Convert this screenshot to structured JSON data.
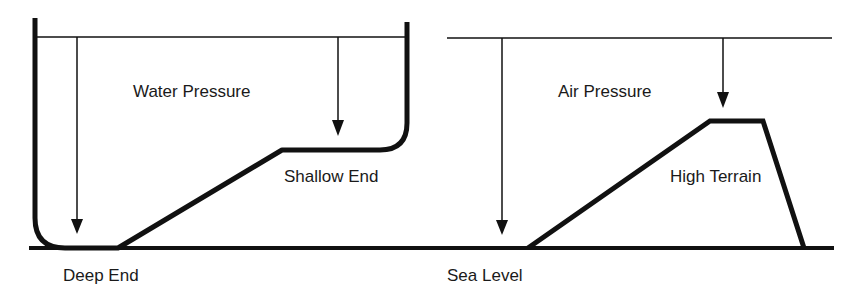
{
  "diagram": {
    "left_panel": {
      "title": "Water Pressure",
      "labels": {
        "pressure": "Water Pressure",
        "shallow": "Shallow End",
        "deep": "Deep End"
      }
    },
    "right_panel": {
      "title": "Air Pressure",
      "labels": {
        "pressure": "Air Pressure",
        "terrain": "High Terrain",
        "sea": "Sea Level"
      }
    },
    "colors": {
      "stroke": "#111111",
      "background": "#ffffff",
      "text": "#1a1a1a"
    }
  }
}
